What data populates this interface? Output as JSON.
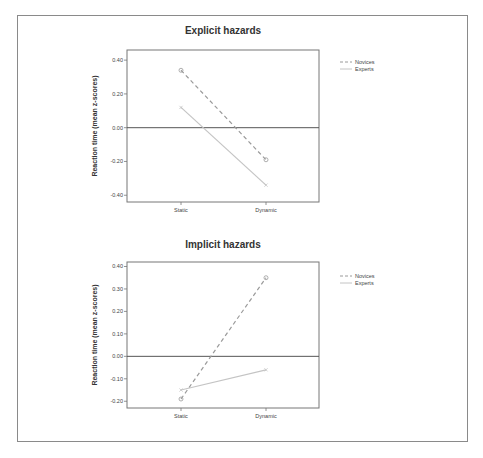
{
  "chart_data": [
    {
      "type": "line",
      "title": "Explicit hazards",
      "xlabel": "",
      "ylabel": "Reaction time (mean z-scores)",
      "categories": [
        "Static",
        "Dynamic"
      ],
      "yticks": [
        "0.40",
        "0.20",
        "0.00",
        "-0.20",
        "-0.40"
      ],
      "ylim": [
        -0.44,
        0.46
      ],
      "reference_line": 0.0,
      "legend_position": "right",
      "series": [
        {
          "name": "Novices",
          "style": "dashed",
          "marker": "circle",
          "values": [
            0.34,
            -0.19
          ]
        },
        {
          "name": "Experts",
          "style": "solid",
          "marker": "x",
          "values": [
            0.12,
            -0.34
          ]
        }
      ]
    },
    {
      "type": "line",
      "title": "Implicit hazards",
      "xlabel": "",
      "ylabel": "Reaction time (mean z-scores)",
      "categories": [
        "Static",
        "Dynamic"
      ],
      "yticks": [
        "0.40",
        "0.30",
        "0.20",
        "0.10",
        "0.00",
        "-0.10",
        "-0.20"
      ],
      "ylim": [
        -0.23,
        0.42
      ],
      "reference_line": 0.0,
      "legend_position": "right",
      "series": [
        {
          "name": "Novices",
          "style": "dashed",
          "marker": "circle",
          "values": [
            -0.19,
            0.35
          ]
        },
        {
          "name": "Experts",
          "style": "solid",
          "marker": "x",
          "values": [
            -0.15,
            -0.06
          ]
        }
      ]
    }
  ],
  "colors": {
    "novices": "#9a9a9a",
    "experts": "#c4c4c4",
    "axis": "#777777",
    "zero_line": "#555555"
  }
}
